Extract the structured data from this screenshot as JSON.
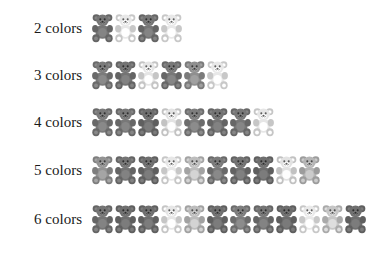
{
  "figure": {
    "title": "",
    "background_color": "#ffffff",
    "label_color": "#1a1a1a",
    "icon_name": "gummy-bear-icon"
  },
  "palette": {
    "dark": "#6e6e6e",
    "mid_dark": "#8a8a8a",
    "mid": "#9d9d9d",
    "light": "#c3c3c3",
    "very_light": "#e2e2e2",
    "pale": "#efefef"
  },
  "chart_data": {
    "type": "bar",
    "title": "",
    "xlabel": "",
    "ylabel": "",
    "categories": [
      "2 colors",
      "3 colors",
      "4 colors",
      "5 colors",
      "6 colors"
    ],
    "values": [
      4,
      6,
      8,
      10,
      12
    ],
    "unit": "bears",
    "grid": false,
    "legend": "none",
    "note": "Pictogram chart: each row shows one gummy bear icon per unit; icon shade indicates color class."
  },
  "rows": [
    {
      "label": "2 colors",
      "count": 4,
      "top": 12,
      "label_top": 21,
      "shades": [
        "#767676",
        "#e8e8e8",
        "#767676",
        "#e8e8e8"
      ]
    },
    {
      "label": "3 colors",
      "count": 6,
      "top": 59,
      "label_top": 68,
      "shades": [
        "#7b7b7b",
        "#747474",
        "#e5e5e5",
        "#787878",
        "#8f8f8f",
        "#e8e8e8"
      ]
    },
    {
      "label": "4 colors",
      "count": 8,
      "top": 106,
      "label_top": 115,
      "shades": [
        "#7a7a7a",
        "#787878",
        "#6f6f6f",
        "#e3e3e3",
        "#7d7d7d",
        "#747474",
        "#787878",
        "#e6e6e6"
      ]
    },
    {
      "label": "5 colors",
      "count": 10,
      "top": 154,
      "label_top": 163,
      "shades": [
        "#939393",
        "#747474",
        "#6f6f6f",
        "#e7e7e7",
        "#bdbdbd",
        "#7a7a7a",
        "#727272",
        "#6f6f6f",
        "#e2e2e2",
        "#b5b5b5"
      ]
    },
    {
      "label": "6 colors",
      "count": 12,
      "top": 203,
      "label_top": 212,
      "shades": [
        "#757575",
        "#6f6f6f",
        "#6f6f6f",
        "#e6e6e6",
        "#bcbcbc",
        "#6f6f6f",
        "#7d7d7d",
        "#757575",
        "#6d6d6d",
        "#e9e9e9",
        "#c6c6c6",
        "#6f6f6f"
      ]
    }
  ]
}
